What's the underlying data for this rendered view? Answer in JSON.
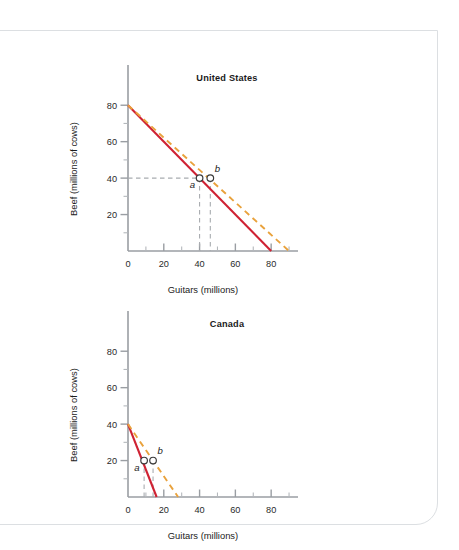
{
  "figure": {
    "background_color": "#ffffff",
    "card_border_color": "#dcdfe2",
    "solid_color": "#cf2233",
    "dashed_color": "#e9a23c",
    "guide_color": "#a8acb0"
  },
  "chart_data": [
    {
      "id": "united-states",
      "type": "line",
      "title": "United States",
      "xlabel": "Guitars (millions)",
      "ylabel": "Beef (millions of cows)",
      "xlim": [
        0,
        95
      ],
      "ylim": [
        0,
        90
      ],
      "xticks_major": [
        0,
        20,
        40,
        60,
        80
      ],
      "xticks_minor": [
        10,
        30,
        50,
        70,
        90
      ],
      "yticks_major": [
        20,
        40,
        60,
        80
      ],
      "yticks_minor": [
        10,
        30,
        50,
        70
      ],
      "grid": false,
      "legend": "none",
      "series": [
        {
          "name": "production possibilities frontier",
          "style": "solid",
          "color": "#cf2233",
          "x": [
            0,
            80
          ],
          "y": [
            80,
            0
          ]
        },
        {
          "name": "consumption possibilities with trade",
          "style": "dashed",
          "color": "#e9a23c",
          "x": [
            0,
            90
          ],
          "y": [
            80,
            0
          ]
        }
      ],
      "points": [
        {
          "label": "a",
          "x": 40,
          "y": 40,
          "label_pos": "below-left",
          "guides": [
            "x",
            "y"
          ]
        },
        {
          "label": "b",
          "x": 46,
          "y": 40,
          "label_pos": "above-right",
          "guides": [
            "x"
          ]
        }
      ]
    },
    {
      "id": "canada",
      "type": "line",
      "title": "Canada",
      "xlabel": "Guitars (millions)",
      "ylabel": "Beef (millions of cows)",
      "xlim": [
        0,
        95
      ],
      "ylim": [
        0,
        90
      ],
      "xticks_major": [
        0,
        20,
        40,
        60,
        80
      ],
      "xticks_minor": [
        10,
        30,
        50,
        70,
        90
      ],
      "yticks_major": [
        20,
        40,
        60,
        80
      ],
      "yticks_minor": [
        10,
        30,
        50,
        70
      ],
      "grid": false,
      "legend": "none",
      "series": [
        {
          "name": "production possibilities frontier",
          "style": "solid",
          "color": "#cf2233",
          "x": [
            0,
            16
          ],
          "y": [
            40,
            0
          ]
        },
        {
          "name": "consumption possibilities with trade",
          "style": "dashed",
          "color": "#e9a23c",
          "x": [
            0,
            28
          ],
          "y": [
            40,
            0
          ]
        }
      ],
      "points": [
        {
          "label": "a",
          "x": 9,
          "y": 20,
          "label_pos": "below-left",
          "guides": [
            "x"
          ]
        },
        {
          "label": "b",
          "x": 14,
          "y": 20,
          "label_pos": "above-right",
          "guides": [
            "x"
          ]
        }
      ]
    }
  ]
}
